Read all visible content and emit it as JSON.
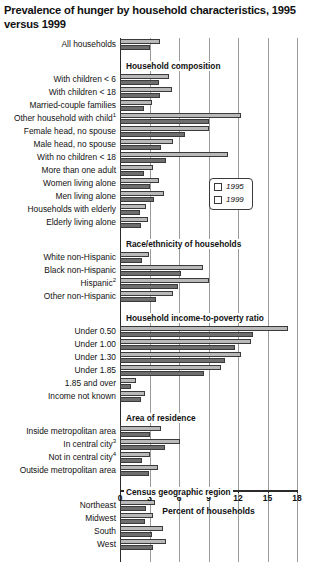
{
  "chart_data": {
    "type": "bar",
    "orientation": "horizontal",
    "title": "Prevalence of hunger by household characteristics, 1995 versus 1999",
    "xlabel": "Percent of households",
    "ylabel": "",
    "xlim": [
      0,
      18
    ],
    "xticks": [
      0,
      3,
      6,
      9,
      12,
      15,
      18
    ],
    "grid": true,
    "legend": {
      "position": "inside-upper-right",
      "entries": [
        {
          "name": "1995",
          "color": "#b9b9b9"
        },
        {
          "name": "1999",
          "color": "#6e6e6e"
        }
      ]
    },
    "series": [
      {
        "name": "1995",
        "color": "#b9b9b9"
      },
      {
        "name": "1999",
        "color": "#6e6e6e"
      }
    ],
    "sections": [
      {
        "header": "",
        "rows": [
          {
            "label": "All households",
            "v1995": 4.1,
            "v1999": 3.0
          }
        ]
      },
      {
        "header": "Household composition",
        "rows": [
          {
            "label": "With children < 6",
            "v1995": 5.0,
            "v1999": 4.0
          },
          {
            "label": "With children < 18",
            "v1995": 5.3,
            "v1999": 4.1
          },
          {
            "label": "Married-couple families",
            "v1995": 3.3,
            "v1999": 2.4
          },
          {
            "label": "Other household with child",
            "footnote": "1",
            "v1995": 12.3,
            "v1999": 9.0
          },
          {
            "label": "Female head, no spouse",
            "v1995": 9.0,
            "v1999": 6.6
          },
          {
            "label": "Male head, no spouse",
            "v1995": 5.4,
            "v1999": 4.2
          },
          {
            "label": "With no children < 18",
            "v1995": 11.0,
            "v1999": 4.7
          },
          {
            "label": "More than one adult",
            "v1995": 3.4,
            "v1999": 2.4
          },
          {
            "label": "Women living alone",
            "v1995": 4.0,
            "v1999": 3.0
          },
          {
            "label": "Men living alone",
            "v1995": 4.5,
            "v1999": 3.5
          },
          {
            "label": "Households with elderly",
            "v1995": 2.6,
            "v1999": 2.0
          },
          {
            "label": "Elderly living alone",
            "v1995": 2.8,
            "v1999": 2.1
          }
        ]
      },
      {
        "header": "Race/ethnicity of households",
        "rows": [
          {
            "label": "White non-Hispanic",
            "v1995": 2.9,
            "v1999": 2.2
          },
          {
            "label": "Black non-Hispanic",
            "v1995": 8.4,
            "v1999": 6.2
          },
          {
            "label": "Hispanic",
            "footnote": "2",
            "v1995": 9.1,
            "v1999": 5.9
          },
          {
            "label": "Other non-Hispanic",
            "v1995": 5.4,
            "v1999": 3.7
          }
        ]
      },
      {
        "header": "Household income-to-poverty ratio",
        "rows": [
          {
            "label": "Under 0.50",
            "v1995": 17.1,
            "v1999": 13.5
          },
          {
            "label": "Under 1.00",
            "v1995": 13.3,
            "v1999": 11.7
          },
          {
            "label": "Under 1.30",
            "v1995": 12.3,
            "v1999": 10.7
          },
          {
            "label": "Under 1.85",
            "v1995": 10.3,
            "v1999": 8.5
          },
          {
            "label": "1.85 and over",
            "v1995": 1.6,
            "v1999": 1.1
          },
          {
            "label": "Income not known",
            "v1995": 2.5,
            "v1999": 2.1
          }
        ]
      },
      {
        "header": "Area of residence",
        "rows": [
          {
            "label": "Inside metropolitan area",
            "v1995": 4.2,
            "v1999": 3.1
          },
          {
            "label": "In central city",
            "footnote": "3",
            "v1995": 6.1,
            "v1999": 4.6
          },
          {
            "label": "Not in central city",
            "footnote": "4",
            "v1995": 3.0,
            "v1999": 2.2
          },
          {
            "label": "Outside metropolitan area",
            "v1995": 3.9,
            "v1999": 2.9
          }
        ]
      },
      {
        "header": "Census geographic region",
        "rows": [
          {
            "label": "Northeast",
            "v1995": 3.6,
            "v1999": 2.6
          },
          {
            "label": "Midwest",
            "v1995": 3.4,
            "v1999": 2.5
          },
          {
            "label": "South",
            "v1995": 4.4,
            "v1999": 3.3
          },
          {
            "label": "West",
            "v1995": 4.7,
            "v1999": 3.4
          }
        ]
      }
    ]
  }
}
